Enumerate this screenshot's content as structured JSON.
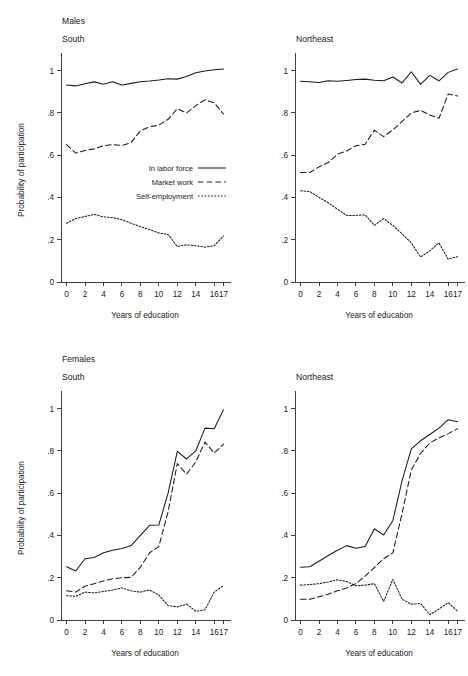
{
  "figure": {
    "group_labels": [
      "Males",
      "Females"
    ],
    "axis": {
      "xlabel": "Years of education",
      "ylabel": "Probability of participation",
      "xticks": [
        0,
        2,
        4,
        6,
        8,
        10,
        12,
        14,
        16,
        17
      ],
      "xtick_labels": [
        "0",
        "2",
        "4",
        "6",
        "8",
        "10",
        "12",
        "14",
        "16",
        "17"
      ],
      "yticks": [
        0,
        0.2,
        0.4,
        0.6,
        0.8,
        1
      ],
      "ytick_labels": [
        "0",
        ".2",
        ".4",
        ".6",
        ".8",
        "1"
      ],
      "xlim": [
        -0.6,
        17.6
      ],
      "ylim": [
        0,
        1.06
      ],
      "grid": false
    },
    "legend": {
      "position": "inside-right",
      "entries": [
        {
          "label": "In labor force",
          "style": "solid"
        },
        {
          "label": "Market work",
          "style": "dashed"
        },
        {
          "label": "Self-employment",
          "style": "dotted"
        }
      ]
    }
  },
  "chart_data": [
    {
      "id": "males-south",
      "type": "line",
      "title": "South",
      "group": "Males",
      "xlabel": "Years of education",
      "ylabel": "Probability of participation",
      "xlim": [
        -0.6,
        17.6
      ],
      "ylim": [
        0,
        1.06
      ],
      "x": [
        0,
        1,
        2,
        3,
        4,
        5,
        6,
        7,
        8,
        9,
        10,
        11,
        12,
        13,
        14,
        15,
        16,
        17
      ],
      "series": [
        {
          "name": "In labor force",
          "style": "solid",
          "values": [
            0.932,
            0.928,
            0.938,
            0.947,
            0.936,
            0.948,
            0.932,
            0.94,
            0.948,
            0.951,
            0.956,
            0.962,
            0.96,
            0.972,
            0.99,
            0.998,
            1.004,
            1.008
          ]
        },
        {
          "name": "Market work",
          "style": "dashed",
          "values": [
            0.65,
            0.61,
            0.622,
            0.63,
            0.645,
            0.65,
            0.646,
            0.66,
            0.715,
            0.735,
            0.742,
            0.77,
            0.82,
            0.8,
            0.835,
            0.862,
            0.848,
            0.795
          ]
        },
        {
          "name": "Self-employment",
          "style": "dotted",
          "values": [
            0.278,
            0.3,
            0.31,
            0.32,
            0.308,
            0.305,
            0.295,
            0.278,
            0.262,
            0.248,
            0.232,
            0.225,
            0.168,
            0.176,
            0.172,
            0.165,
            0.172,
            0.218
          ]
        }
      ]
    },
    {
      "id": "males-northeast",
      "type": "line",
      "title": "Northeast",
      "group": "Males",
      "xlabel": "Years of education",
      "ylabel": "",
      "xlim": [
        -0.6,
        17.6
      ],
      "ylim": [
        0,
        1.06
      ],
      "x": [
        0,
        1,
        2,
        3,
        4,
        5,
        6,
        7,
        8,
        9,
        10,
        11,
        12,
        13,
        14,
        15,
        16,
        17
      ],
      "series": [
        {
          "name": "In labor force",
          "style": "solid",
          "values": [
            0.95,
            0.948,
            0.944,
            0.952,
            0.95,
            0.954,
            0.958,
            0.96,
            0.955,
            0.952,
            0.97,
            0.942,
            0.995,
            0.935,
            0.978,
            0.952,
            0.992,
            1.008
          ]
        },
        {
          "name": "Market work",
          "style": "dashed",
          "values": [
            0.518,
            0.518,
            0.545,
            0.565,
            0.605,
            0.62,
            0.645,
            0.652,
            0.718,
            0.688,
            0.72,
            0.76,
            0.8,
            0.812,
            0.79,
            0.775,
            0.89,
            0.88
          ]
        },
        {
          "name": "Self-employment",
          "style": "dotted",
          "values": [
            0.432,
            0.428,
            0.4,
            0.375,
            0.345,
            0.315,
            0.315,
            0.318,
            0.268,
            0.3,
            0.268,
            0.228,
            0.185,
            0.118,
            0.148,
            0.185,
            0.108,
            0.12
          ]
        }
      ]
    },
    {
      "id": "females-south",
      "type": "line",
      "title": "South",
      "group": "Females",
      "xlabel": "Years of education",
      "ylabel": "Probability of participation",
      "xlim": [
        -0.6,
        17.6
      ],
      "ylim": [
        0,
        1.06
      ],
      "x": [
        0,
        1,
        2,
        3,
        4,
        5,
        6,
        7,
        8,
        9,
        10,
        11,
        12,
        13,
        14,
        15,
        16,
        17
      ],
      "series": [
        {
          "name": "In labor force",
          "style": "solid",
          "values": [
            0.252,
            0.232,
            0.29,
            0.296,
            0.318,
            0.33,
            0.338,
            0.352,
            0.4,
            0.448,
            0.45,
            0.6,
            0.798,
            0.762,
            0.8,
            0.908,
            0.905,
            0.995
          ]
        },
        {
          "name": "Market work",
          "style": "dashed",
          "values": [
            0.138,
            0.132,
            0.16,
            0.172,
            0.185,
            0.195,
            0.2,
            0.202,
            0.25,
            0.318,
            0.348,
            0.512,
            0.74,
            0.69,
            0.748,
            0.842,
            0.79,
            0.832
          ]
        },
        {
          "name": "Self-employment",
          "style": "dotted",
          "values": [
            0.115,
            0.112,
            0.132,
            0.128,
            0.135,
            0.142,
            0.152,
            0.138,
            0.132,
            0.142,
            0.118,
            0.068,
            0.062,
            0.075,
            0.042,
            0.048,
            0.132,
            0.162
          ]
        }
      ]
    },
    {
      "id": "females-northeast",
      "type": "line",
      "title": "Northeast",
      "group": "Females",
      "xlabel": "Years of education",
      "ylabel": "",
      "xlim": [
        -0.6,
        17.6
      ],
      "ylim": [
        0,
        1.06
      ],
      "x": [
        0,
        1,
        2,
        3,
        4,
        5,
        6,
        7,
        8,
        9,
        10,
        11,
        12,
        13,
        14,
        15,
        16,
        17
      ],
      "series": [
        {
          "name": "In labor force",
          "style": "solid",
          "values": [
            0.25,
            0.252,
            0.278,
            0.305,
            0.33,
            0.352,
            0.34,
            0.348,
            0.432,
            0.402,
            0.47,
            0.66,
            0.81,
            0.848,
            0.878,
            0.908,
            0.948,
            0.938
          ]
        },
        {
          "name": "Market work",
          "style": "dashed",
          "values": [
            0.098,
            0.098,
            0.11,
            0.122,
            0.138,
            0.152,
            0.172,
            0.208,
            0.248,
            0.29,
            0.318,
            0.505,
            0.71,
            0.788,
            0.838,
            0.862,
            0.882,
            0.905
          ]
        },
        {
          "name": "Self-employment",
          "style": "dotted",
          "values": [
            0.165,
            0.168,
            0.172,
            0.18,
            0.19,
            0.182,
            0.162,
            0.165,
            0.172,
            0.088,
            0.192,
            0.098,
            0.075,
            0.078,
            0.025,
            0.052,
            0.082,
            0.042
          ]
        }
      ]
    }
  ]
}
